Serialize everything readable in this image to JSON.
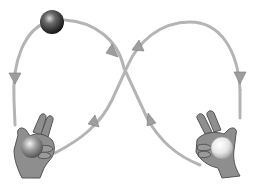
{
  "diagram": {
    "colors": {
      "background": "#ffffff",
      "path": "#b4b4b4",
      "arrow": "#9a9a9a",
      "hand_fill": "#8c8c8c",
      "hand_stroke": "#555555",
      "ball_dark": "#2a2a2a",
      "ball_light": "#e8e8e8"
    },
    "elements": [
      {
        "name": "ball-dark-airborne",
        "label": "dark ball in the air"
      },
      {
        "name": "left-hand",
        "label": "left hand holding dark ball"
      },
      {
        "name": "right-hand",
        "label": "right hand holding light ball"
      },
      {
        "name": "trajectory-path",
        "label": "figure-eight throw path with direction arrows"
      }
    ]
  }
}
